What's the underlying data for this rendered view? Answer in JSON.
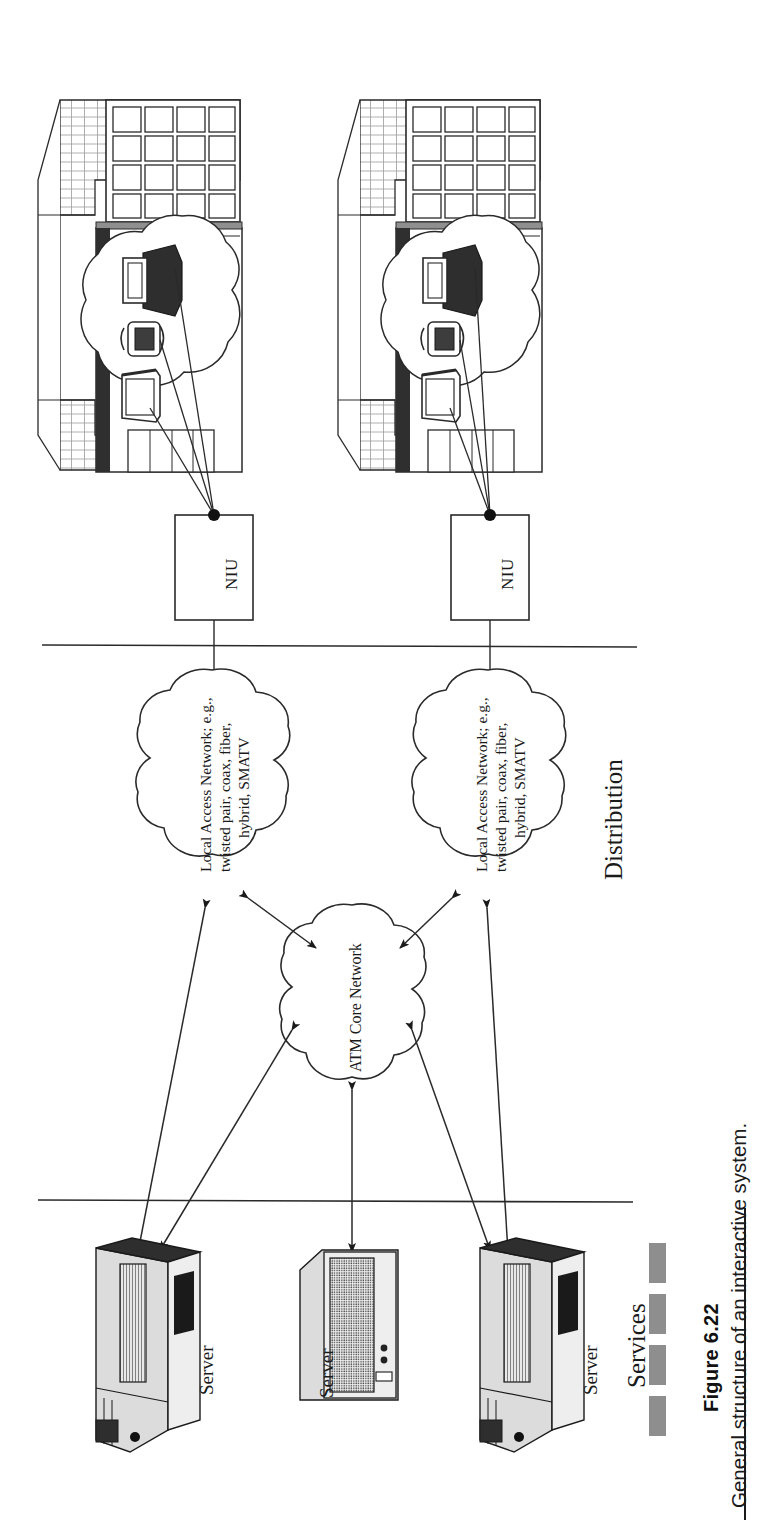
{
  "figure": {
    "number": "Figure 6.22",
    "caption": "General structure of an interactive system.",
    "orientation": "rotated-90-ccw",
    "page_width": 771,
    "page_height": 1535
  },
  "diagram": {
    "title": "General structure of an interactive system",
    "type": "network-architecture",
    "sections": [
      {
        "id": "distribution",
        "label": "Distribution"
      },
      {
        "id": "services",
        "label": "Services"
      }
    ],
    "dividers": [
      {
        "id": "premises-distribution-divider"
      },
      {
        "id": "distribution-services-divider"
      }
    ],
    "premises": [
      {
        "id": "home-1",
        "label": "",
        "devices": [
          "television-icon",
          "telephone-icon",
          "computer-icon"
        ],
        "connects_to": "niu-1"
      },
      {
        "id": "home-2",
        "label": "",
        "devices": [
          "television-icon",
          "telephone-icon",
          "computer-icon"
        ],
        "connects_to": "niu-2"
      }
    ],
    "niu_boxes": [
      {
        "id": "niu-1",
        "label": "NIU"
      },
      {
        "id": "niu-2",
        "label": "NIU"
      }
    ],
    "access_clouds": [
      {
        "id": "access-cloud-1",
        "lines": [
          "Local Access Network; e.g.,",
          "twisted pair, coax, fiber,",
          "hybrid, SMATV"
        ],
        "text": "Local Access Network; e.g., twisted pair, coax, fiber, hybrid, SMATV"
      },
      {
        "id": "access-cloud-2",
        "lines": [
          "Local Access Network; e.g.,",
          "twisted pair, coax, fiber,",
          "hybrid, SMATV"
        ],
        "text": "Local Access Network; e.g., twisted pair, coax, fiber, hybrid, SMATV"
      }
    ],
    "core_cloud": {
      "id": "atm-core-network",
      "label": "ATM Core Network"
    },
    "servers": [
      {
        "id": "server-1",
        "label": "Server",
        "style": "tower"
      },
      {
        "id": "server-2",
        "label": "Server",
        "style": "desktop"
      },
      {
        "id": "server-3",
        "label": "Server",
        "style": "tower"
      }
    ],
    "links": [
      {
        "from": "access-cloud-1",
        "to": "atm-core-network",
        "arrow": "double"
      },
      {
        "from": "access-cloud-2",
        "to": "atm-core-network",
        "arrow": "double"
      },
      {
        "from": "access-cloud-1",
        "to": "server-1",
        "arrow": "double"
      },
      {
        "from": "access-cloud-2",
        "to": "server-3",
        "arrow": "double"
      },
      {
        "from": "atm-core-network",
        "to": "server-1",
        "arrow": "double"
      },
      {
        "from": "atm-core-network",
        "to": "server-2",
        "arrow": "double"
      },
      {
        "from": "atm-core-network",
        "to": "server-3",
        "arrow": "double"
      },
      {
        "from": "niu-1",
        "to": "access-cloud-1",
        "arrow": "none"
      },
      {
        "from": "niu-2",
        "to": "access-cloud-2",
        "arrow": "none"
      }
    ]
  },
  "colors": {
    "ink": "#1a1a1a",
    "paper": "#ffffff",
    "swatch_gray": "#8e8e8e",
    "shade_light": "#dcdcdc",
    "shade_mid": "#9a9a9a",
    "shade_dark": "#3a3a3a"
  },
  "decor": {
    "swatch_count": 4,
    "swatch_label": "caption-swatch"
  }
}
